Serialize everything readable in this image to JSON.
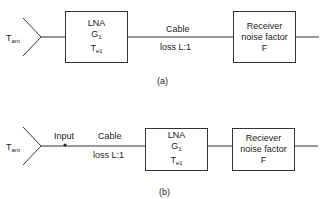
{
  "diagram_a": {
    "antenna": {
      "label": "T",
      "sub": "ant"
    },
    "lna": {
      "name": "LNA",
      "gain": "G",
      "gain_sub": "1",
      "temp": "T",
      "temp_sub": "e1"
    },
    "cable": {
      "label": "Cable",
      "loss": "loss L:1"
    },
    "receiver": {
      "line1": "Receiver",
      "line2": "noise factor",
      "line3": "F"
    },
    "caption": "(a)"
  },
  "diagram_b": {
    "antenna": {
      "label": "T",
      "sub": "ant"
    },
    "input_label": "Input",
    "cable": {
      "label": "Cable",
      "loss": "loss L:1"
    },
    "lna": {
      "name": "LNA",
      "gain": "G",
      "gain_sub": "1",
      "temp": "T",
      "temp_sub": "e1"
    },
    "receiver": {
      "line1": "Reciever",
      "line2": "noise factor",
      "line3": "F"
    },
    "caption": "(b)"
  }
}
